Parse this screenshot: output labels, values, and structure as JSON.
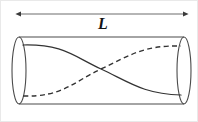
{
  "figure": {
    "kind": "cylinder-standing-wave-diagram",
    "background_color": "#ffffff",
    "stroke_color": "#3a3a3a",
    "label_color": "#141414",
    "width": 198,
    "height": 122,
    "dimension_label": "L",
    "dimension_arrow": {
      "label": "L",
      "x_start": 19,
      "x_end": 183,
      "y": 13,
      "arrowheads": "both"
    },
    "cylinder": {
      "top_line_y": 36,
      "bottom_line_y": 103,
      "left_ellipse": {
        "cx": 18,
        "cy": 69.5,
        "rx": 7,
        "ry": 33.5
      },
      "right_ellipse": {
        "cx": 183,
        "cy": 69.5,
        "rx": 7,
        "ry": 33.5
      }
    },
    "curves": [
      {
        "name": "front-wave",
        "style": "solid",
        "start": {
          "x": 22,
          "y": 44
        },
        "end": {
          "x": 180,
          "y": 94
        },
        "crossing": {
          "x": 100,
          "y": 68
        }
      },
      {
        "name": "back-wave",
        "style": "dashed",
        "start": {
          "x": 22,
          "y": 95
        },
        "end": {
          "x": 180,
          "y": 45
        },
        "crossing": {
          "x": 100,
          "y": 68
        }
      }
    ]
  }
}
